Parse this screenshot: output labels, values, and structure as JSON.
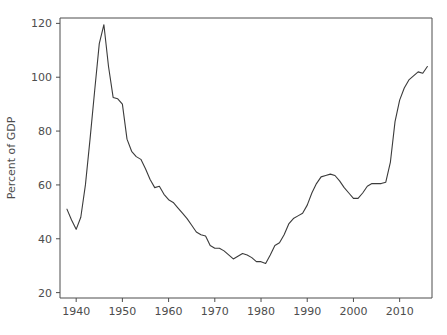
{
  "chart_data": {
    "type": "line",
    "title": "",
    "xlabel": "",
    "ylabel": "Percent of GDP",
    "xlim": [
      1936.5,
      2017.0
    ],
    "ylim": [
      18.0,
      122.0
    ],
    "grid": false,
    "legend": "none",
    "xticks": [
      1940,
      1950,
      1960,
      1970,
      1980,
      1990,
      2000,
      2010
    ],
    "xtick_labels": [
      "1940",
      "1950",
      "1960",
      "1970",
      "1980",
      "1990",
      "2000",
      "2010"
    ],
    "yticks": [
      20,
      40,
      60,
      80,
      100,
      120
    ],
    "ytick_labels": [
      "20",
      "40",
      "60",
      "80",
      "100",
      "120"
    ],
    "series": [
      {
        "name": "Federal debt",
        "color": "#3b3b3b",
        "x": [
          1938,
          1939,
          1940,
          1941,
          1942,
          1943,
          1944,
          1945,
          1946,
          1947,
          1948,
          1949,
          1950,
          1951,
          1952,
          1953,
          1954,
          1955,
          1956,
          1957,
          1958,
          1959,
          1960,
          1961,
          1962,
          1963,
          1964,
          1965,
          1966,
          1967,
          1968,
          1969,
          1970,
          1971,
          1972,
          1973,
          1974,
          1975,
          1976,
          1977,
          1978,
          1979,
          1980,
          1981,
          1982,
          1983,
          1984,
          1985,
          1986,
          1987,
          1988,
          1989,
          1990,
          1991,
          1992,
          1993,
          1994,
          1995,
          1996,
          1997,
          1998,
          1999,
          2000,
          2001,
          2002,
          2003,
          2004,
          2005,
          2006,
          2007,
          2008,
          2009,
          2010,
          2011,
          2012,
          2013,
          2014,
          2015,
          2016
        ],
        "y": [
          51.0,
          47.0,
          43.5,
          48.0,
          60.0,
          77.0,
          95.0,
          112.5,
          119.5,
          104.0,
          92.5,
          92.0,
          90.0,
          77.0,
          72.5,
          70.5,
          69.5,
          66.0,
          62.0,
          59.0,
          59.5,
          56.5,
          54.5,
          53.5,
          51.5,
          49.5,
          47.5,
          45.0,
          42.5,
          41.5,
          41.0,
          37.5,
          36.5,
          36.5,
          35.5,
          34.0,
          32.5,
          33.5,
          34.5,
          34.0,
          33.0,
          31.5,
          31.5,
          30.8,
          34.0,
          37.5,
          38.5,
          41.5,
          45.5,
          47.5,
          48.5,
          49.5,
          52.5,
          57.0,
          60.5,
          63.0,
          63.5,
          64.0,
          63.5,
          61.5,
          59.0,
          57.0,
          55.0,
          55.0,
          57.0,
          59.5,
          60.5,
          60.5,
          60.5,
          61.0,
          68.5,
          83.5,
          91.5,
          96.0,
          99.0,
          100.5,
          102.0,
          101.5,
          104.0
        ]
      }
    ]
  },
  "axes": {
    "y_axis_title": "Percent of GDP"
  }
}
